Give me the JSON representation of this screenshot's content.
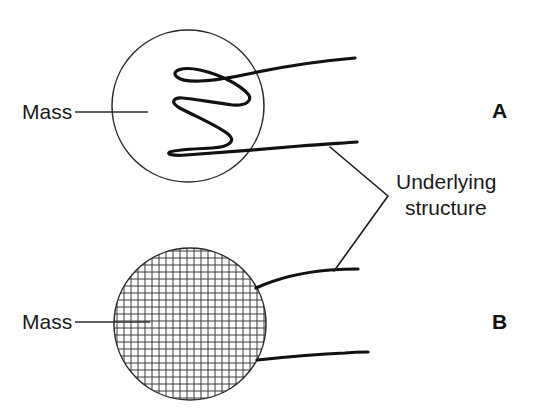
{
  "figure": {
    "background_color": "#ffffff",
    "line_color": "#1a1a1a",
    "width": 537,
    "height": 415
  },
  "labels": {
    "mass_top": "Mass",
    "mass_bottom": "Mass",
    "underlying_line1": "Underlying",
    "underlying_line2": "structure",
    "panel_a": "A",
    "panel_b": "B"
  },
  "panels": [
    {
      "id": "A",
      "letter": "A",
      "mass_label": "Mass",
      "circle": {
        "cx": 188,
        "cy": 106,
        "r": 76,
        "fill": "none"
      },
      "interior_pattern": "serpentine-curve",
      "description": "Outlined circle containing a single thick serpentine folded curve"
    },
    {
      "id": "B",
      "letter": "B",
      "mass_label": "Mass",
      "circle": {
        "cx": 190,
        "cy": 324,
        "r": 76,
        "fill": "crosshatch-grid"
      },
      "interior_pattern": "cross-hatch-grid",
      "grid_spacing": 7,
      "description": "Outlined circle filled with a fine regular cross-hatch grid"
    }
  ],
  "annotations": {
    "underlying_structure": {
      "text_line1": "Underlying",
      "text_line2": "structure",
      "bracket_vertex": {
        "x": 388,
        "y": 196
      },
      "points_to": [
        "panel-a-lower-strand",
        "panel-b-upper-strand"
      ]
    }
  }
}
